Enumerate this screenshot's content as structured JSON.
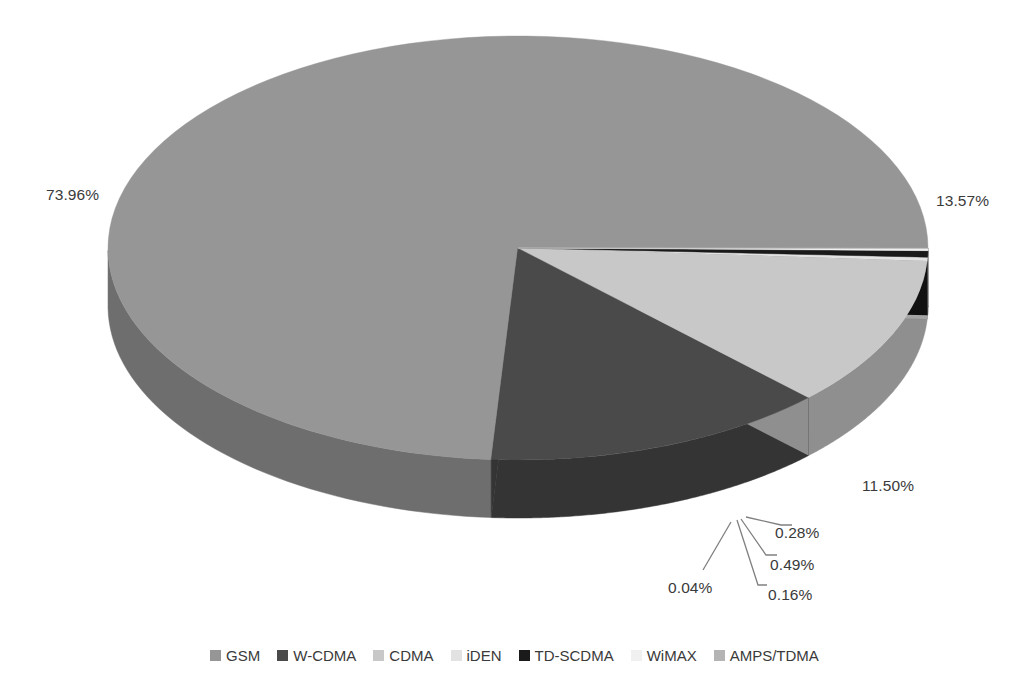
{
  "chart_data": {
    "type": "pie",
    "title": "",
    "subtitle": "",
    "xlabel": "",
    "ylabel": "",
    "three_d": true,
    "grid": false,
    "legend_position": "bottom",
    "value_unit": "percent",
    "categories": [
      "GSM",
      "W-CDMA",
      "CDMA",
      "iDEN",
      "TD-SCDMA",
      "WiMAX",
      "AMPS/TDMA"
    ],
    "values": [
      73.96,
      13.57,
      11.5,
      0.28,
      0.49,
      0.16,
      0.04
    ],
    "labels": [
      "73.96%",
      "13.57%",
      "11.50%",
      "0.28%",
      "0.49%",
      "0.16%",
      "0.04%"
    ],
    "colors": [
      "#969696",
      "#4a4a4a",
      "#c8c8c8",
      "#e2e2e2",
      "#1a1a1a",
      "#f0f0f0",
      "#b4b4b4"
    ],
    "slices": [
      {
        "name": "GSM",
        "value": 73.96,
        "label": "73.96%",
        "color": "#969696",
        "side_color": "#6e6e6e"
      },
      {
        "name": "W-CDMA",
        "value": 13.57,
        "label": "13.57%",
        "color": "#4a4a4a",
        "side_color": "#343434"
      },
      {
        "name": "CDMA",
        "value": 11.5,
        "label": "11.50%",
        "color": "#c8c8c8",
        "side_color": "#8f8f8f"
      },
      {
        "name": "iDEN",
        "value": 0.28,
        "label": "0.28%",
        "color": "#e2e2e2",
        "side_color": "#a6a6a6"
      },
      {
        "name": "TD-SCDMA",
        "value": 0.49,
        "label": "0.49%",
        "color": "#1a1a1a",
        "side_color": "#111111"
      },
      {
        "name": "WiMAX",
        "value": 0.16,
        "label": "0.16%",
        "color": "#f0f0f0",
        "side_color": "#b0b0b0"
      },
      {
        "name": "AMPS/TDMA",
        "value": 0.04,
        "label": "0.04%",
        "color": "#b4b4b4",
        "side_color": "#858585"
      }
    ]
  },
  "legend": {
    "items": [
      {
        "label": "GSM",
        "color": "#969696"
      },
      {
        "label": "W-CDMA",
        "color": "#4a4a4a"
      },
      {
        "label": "CDMA",
        "color": "#c8c8c8"
      },
      {
        "label": "iDEN",
        "color": "#e2e2e2"
      },
      {
        "label": "TD-SCDMA",
        "color": "#1a1a1a"
      },
      {
        "label": "WiMAX",
        "color": "#f0f0f0"
      },
      {
        "label": "AMPS/TDMA",
        "color": "#b4b4b4"
      }
    ]
  },
  "labels": {
    "gsm": "73.96%",
    "wcdma": "13.57%",
    "cdma": "11.50%",
    "iden": "0.28%",
    "tdscdma": "0.49%",
    "wimax": "0.16%",
    "amps": "0.04%"
  }
}
